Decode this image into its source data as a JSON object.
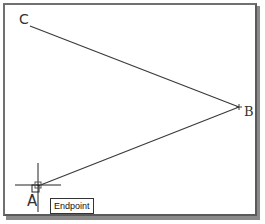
{
  "drawing": {
    "points": {
      "A": {
        "label": "A",
        "x": 38,
        "y": 186
      },
      "B": {
        "label": "B",
        "x": 239,
        "y": 107
      },
      "C": {
        "label": "C",
        "x": 30,
        "y": 26
      }
    },
    "lines": [
      {
        "from": "C",
        "to": "B"
      },
      {
        "from": "B",
        "to": "A"
      }
    ],
    "line_color": "#3a3a3a"
  },
  "cursor": {
    "x": 38,
    "y": 185,
    "type": "crosshair-osnap"
  },
  "osnap_tooltip": {
    "text": "Endpoint"
  }
}
